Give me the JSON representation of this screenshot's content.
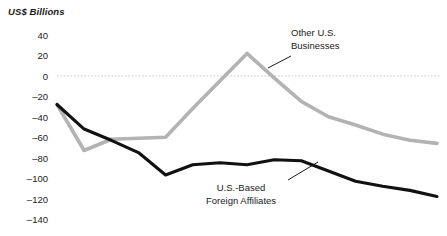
{
  "chart_data": {
    "type": "line",
    "title": "",
    "subtitle": "",
    "ylabel": "US$ Billions",
    "xlabel": "",
    "ylim": [
      -140,
      40
    ],
    "yticks": [
      40,
      20,
      0,
      -20,
      -40,
      -60,
      -80,
      -100,
      -120,
      -140
    ],
    "ytick_labels": [
      "40",
      "20",
      "0",
      "–20",
      "–40",
      "–60",
      "–80",
      "–100",
      "–120",
      "–140"
    ],
    "grid": false,
    "zero_line": true,
    "zero_line_style": "dotted",
    "legend_position": "inline-annotations",
    "x": [
      1,
      2,
      3,
      4,
      5,
      6,
      7,
      8,
      9,
      10,
      11,
      12,
      13,
      14,
      15
    ],
    "series": [
      {
        "name": "Other U.S. Businesses",
        "color": "#b3b3b3",
        "values": [
          -28,
          -73,
          -62,
          -61,
          -60,
          -32,
          -5,
          22,
          -2,
          -25,
          -40,
          -48,
          -57,
          -63,
          -66
        ]
      },
      {
        "name": "U.S.-Based Foreign Affiliates",
        "color": "#111111",
        "values": [
          -28,
          -52,
          -63,
          -75,
          -97,
          -87,
          -85,
          -87,
          -82,
          -83,
          -93,
          -103,
          -108,
          -112,
          -118
        ]
      }
    ],
    "annotations": [
      {
        "id": "other-us-businesses",
        "line1": "Other U.S.",
        "line2": "Businesses",
        "leader": true
      },
      {
        "id": "us-based-foreign-affiliates",
        "line1": "U.S.-Based",
        "line2": "Foreign Affiliates",
        "leader": true
      }
    ]
  },
  "colors": {
    "gray_series": "#b3b3b3",
    "dark_series": "#111111",
    "zero_line": "#d8d8d8",
    "text": "#1a1a1a",
    "background": "#ffffff"
  }
}
